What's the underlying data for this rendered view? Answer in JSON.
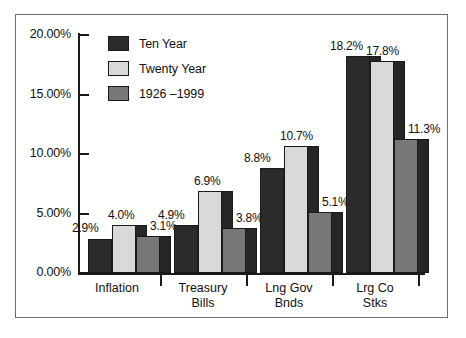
{
  "chart_data": {
    "type": "bar",
    "title": "",
    "xlabel": "",
    "ylabel": "",
    "grid": false,
    "legend_position": "top-left-inside",
    "ylim": [
      0,
      20
    ],
    "y_ticks": [
      "0.00%",
      "5.00%",
      "10.00%",
      "15.00%",
      "20.00%"
    ],
    "y_tick_values": [
      0,
      5,
      10,
      15,
      20
    ],
    "categories": [
      "Inflation",
      "Treasury\nBills",
      "Lng Gov\nBnds",
      "Lrg Co\nStks"
    ],
    "series": [
      {
        "name": "Ten Year",
        "color": "#2b2b2b",
        "values": [
          2.9,
          4.0,
          8.8,
          18.2
        ],
        "labels": [
          "2.9%",
          "4.9%",
          "8.8%",
          "18.2%"
        ]
      },
      {
        "name": "Twenty Year",
        "color": "#d9d9d9",
        "values": [
          4.0,
          6.9,
          10.7,
          17.8
        ],
        "labels": [
          "4.0%",
          "6.9%",
          "10.7%",
          "17.8%"
        ]
      },
      {
        "name": "1926 –1999",
        "color": "#777777",
        "values": [
          3.1,
          3.8,
          5.1,
          11.3
        ],
        "labels": [
          "3.1%",
          "3.8%",
          "5.1%",
          "11.3%"
        ]
      }
    ]
  },
  "legend": {
    "items": [
      {
        "label": "Ten Year",
        "color": "#2b2b2b"
      },
      {
        "label": "Twenty Year",
        "color": "#d9d9d9"
      },
      {
        "label": "1926 –1999",
        "color": "#777777"
      }
    ]
  },
  "axis": {
    "y_labels": [
      "20.00%",
      "15.00%",
      "10.00%",
      "5.00%",
      "0.00%"
    ],
    "category_labels": [
      "Inflation",
      "Treasury\nBills",
      "Lng Gov\nBnds",
      "Lrg Co\nStks"
    ]
  },
  "bar_labels": {
    "inflation": [
      "2.9%",
      "4.0%",
      "3.1%"
    ],
    "treasury_bills": [
      "4.9%",
      "6.9%",
      "3.8%"
    ],
    "lng_gov_bnds": [
      "8.8%",
      "10.7%",
      "5.1%"
    ],
    "lrg_co_stks": [
      "18.2%",
      "17.8%",
      "11.3%"
    ]
  },
  "colors": {
    "series_ten_year": "#2b2b2b",
    "series_twenty_year": "#d9d9d9",
    "series_historical": "#777777",
    "shadow": "#262626",
    "axis": "#1a1a1a",
    "frame": "#6f6f6f",
    "background": "#ffffff"
  }
}
